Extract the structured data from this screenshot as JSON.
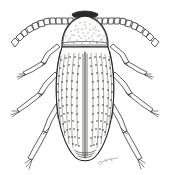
{
  "figure": {
    "title": "Beetle (Coleoptera) dorsal view line illustration",
    "medium": "pen-and-ink scientific illustration",
    "view": "dorsal",
    "orientation": "head up",
    "width_px": 170,
    "height_px": 175,
    "background_color": "#ffffff",
    "ink_color": "#1a1a1a",
    "shading_color": "#4d4d4d"
  },
  "signature": {
    "text": "",
    "visible": true,
    "position": "lower-right of abdomen apex"
  },
  "anatomy": {
    "head": {
      "label": "head",
      "note": "small, largely concealed beneath pronotum; dark transverse band at anterior margin"
    },
    "pronotum": {
      "label": "pronotum",
      "note": "broad dome-shaped shield, finely stippled, dark anterior margin, straight posterior margin"
    },
    "scutellum": {
      "label": "scutellum",
      "note": "small dark triangular plate at base of elytral suture"
    },
    "elytra": {
      "label": "elytra",
      "note": "elongate oval wing covers with longitudinal striae and rows of dark punctures; rounded apex",
      "stria_rows": 10
    },
    "antennae": {
      "label": "antennae",
      "count": 2,
      "segments_each": 11,
      "note": "serrate, bead-like segments sweeping outward and downward from the head"
    },
    "legs": {
      "label": "legs",
      "count": 6,
      "pairs": [
        {
          "name": "prothoracic-legs",
          "label": "front legs"
        },
        {
          "name": "mesothoracic-legs",
          "label": "middle legs"
        },
        {
          "name": "metathoracic-legs",
          "label": "hind legs"
        }
      ],
      "note": "each leg shows femur, tibia and tarsus; drawn in outline with joint hatching"
    }
  },
  "colors": {
    "outline": "#1a1a1a",
    "stipple": "#4d4d4d",
    "dark_band": "#2a2a2a",
    "paper": "#ffffff"
  }
}
